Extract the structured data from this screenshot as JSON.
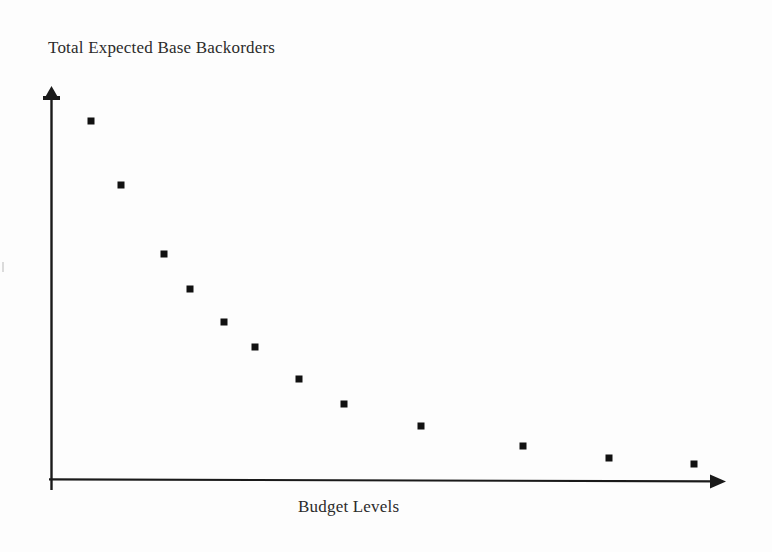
{
  "figure": {
    "kind": "scanned-scatter-plot",
    "background_color": "#fdfdfd",
    "ink_color": "#1a1a1a"
  },
  "labels": {
    "ylabel": "Total Expected Base Backorders",
    "xlabel": "Budget Levels"
  },
  "axes": {
    "origin_px": [
      51,
      480
    ],
    "x_axis_end_px": [
      725,
      481
    ],
    "y_axis_top_px": [
      51,
      88
    ],
    "x_arrow": "arrow-right",
    "y_arrow": "arrow-up",
    "ticks": "none",
    "tick_labels": "none",
    "gridlines": "none"
  },
  "chart_data": {
    "type": "scatter",
    "title": "",
    "xlabel": "Budget Levels",
    "ylabel": "Total Expected Base Backorders",
    "xlim": [
      0,
      1
    ],
    "ylim": [
      0,
      1
    ],
    "grid": false,
    "legend": "none",
    "marker": "filled-square",
    "marker_color": "#111111",
    "marker_size_px": 7,
    "note": "Axes carry no numeric ticks; x and y are normalized 0-1 fractions of the drawn axis spans, read off pixel positions.",
    "x": [
      0.06,
      0.104,
      0.168,
      0.206,
      0.257,
      0.303,
      0.368,
      0.435,
      0.549,
      0.7,
      0.827,
      0.954
    ],
    "y": [
      0.916,
      0.753,
      0.577,
      0.488,
      0.403,
      0.339,
      0.258,
      0.194,
      0.138,
      0.087,
      0.056,
      0.041
    ],
    "points_px": [
      [
        91,
        121
      ],
      [
        121,
        185
      ],
      [
        164,
        254
      ],
      [
        190,
        289
      ],
      [
        224,
        322
      ],
      [
        255,
        347
      ],
      [
        299,
        379
      ],
      [
        344,
        404
      ],
      [
        421,
        426
      ],
      [
        523,
        446
      ],
      [
        609,
        458
      ],
      [
        694,
        464
      ]
    ]
  }
}
